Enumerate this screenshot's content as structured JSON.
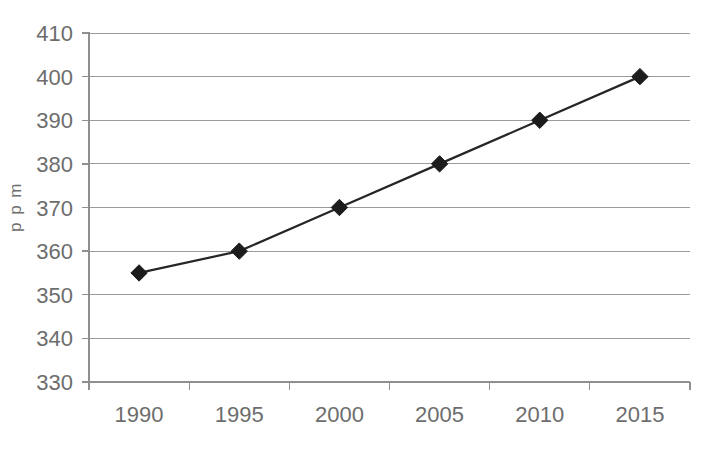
{
  "chart_data": {
    "type": "line",
    "title": "",
    "xlabel": "",
    "ylabel": "p p m",
    "categories": [
      "1990",
      "1995",
      "2000",
      "2005",
      "2010",
      "2015"
    ],
    "x": [
      1990,
      1995,
      2000,
      2005,
      2010,
      2015
    ],
    "values": [
      355,
      360,
      370,
      380,
      390,
      400
    ],
    "series": [
      {
        "name": "",
        "values": [
          355,
          360,
          370,
          380,
          390,
          400
        ]
      }
    ],
    "ylim": [
      330,
      410
    ],
    "ytick_step": 10,
    "yticks": [
      330,
      340,
      350,
      360,
      370,
      380,
      390,
      400,
      410
    ],
    "ytick_labels": [
      "330",
      "340",
      "350",
      "360",
      "370",
      "380",
      "390",
      "400",
      "410"
    ],
    "xtick_labels": [
      "1990",
      "1995",
      "2000",
      "2005",
      "2010",
      "2015"
    ],
    "grid": "horizontal",
    "legend": "none",
    "marker": "diamond",
    "marker_color": "#1c1c1c",
    "line_color": "#262626",
    "gridline_color": "#9b9b9b",
    "axis_color": "#8f8f8f",
    "label_color": "#6d6d6d",
    "background_color": "#ffffff",
    "annotations": []
  }
}
